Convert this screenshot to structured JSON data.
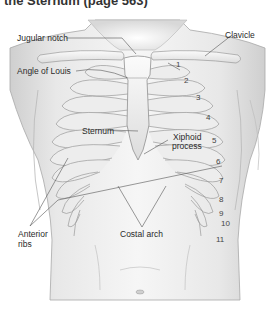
{
  "heading": "the Sternum (page 563)",
  "figure": {
    "labels": {
      "jugular_notch": "Jugular notch",
      "clavicle": "Clavicle",
      "angle_of_louis": "Angle of Louis",
      "sternum": "Sternum",
      "xiphoid_line1": "Xiphoid",
      "xiphoid_line2": "process",
      "anterior_ribs_line1": "Anterior",
      "anterior_ribs_line2": "ribs",
      "costal_arch": "Costal arch"
    },
    "rib_numbers": [
      "1",
      "2",
      "3",
      "4",
      "5",
      "6",
      "7",
      "8",
      "9",
      "10",
      "11"
    ]
  }
}
